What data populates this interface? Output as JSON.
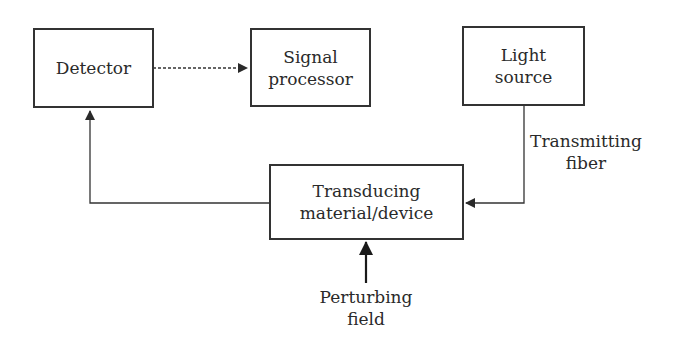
{
  "diagram": {
    "nodes": {
      "detector": {
        "lines": [
          "Detector"
        ]
      },
      "signal_processor": {
        "lines": [
          "Signal",
          "processor"
        ]
      },
      "light_source": {
        "lines": [
          "Light",
          "source"
        ]
      },
      "transducer": {
        "lines": [
          "Transducing",
          "material/device"
        ]
      }
    },
    "labels": {
      "transmitting_fiber": [
        "Transmitting",
        "fiber"
      ],
      "perturbing_field": [
        "Perturbing",
        "field"
      ]
    },
    "edges": [
      {
        "from": "detector",
        "to": "signal_processor",
        "style": "dashed"
      },
      {
        "from": "light_source",
        "to": "transducer",
        "style": "solid",
        "label": "Transmitting fiber"
      },
      {
        "from": "transducer",
        "to": "detector",
        "style": "solid"
      },
      {
        "from": "perturbing_field",
        "to": "transducer",
        "style": "solid-bold"
      }
    ],
    "colors": {
      "stroke": "#333333",
      "text": "#2a2a2a",
      "background": "#ffffff"
    }
  }
}
